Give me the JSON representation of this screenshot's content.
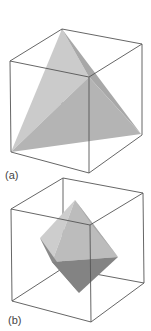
{
  "figure": {
    "panels": [
      {
        "label": "(a)",
        "shape": "tetrahedron inscribed in cube",
        "colors": {
          "face_light": "#cbcbcb",
          "face_mid": "#b6b6b6",
          "face_dark": "#a2a2a2",
          "edge": "#555555"
        }
      },
      {
        "label": "(b)",
        "shape": "octahedron inscribed in cube",
        "colors": {
          "face_light": "#c9c9c9",
          "face_mid": "#b4b4b4",
          "face_dark": "#8e8e8e",
          "face_darker": "#7e7e7e",
          "edge": "#555555"
        }
      }
    ]
  }
}
